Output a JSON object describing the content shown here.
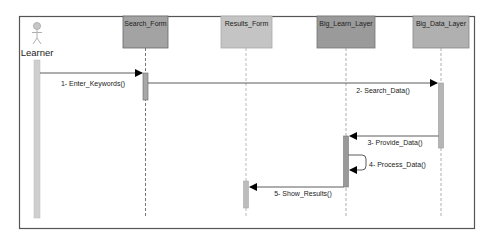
{
  "diagram": {
    "type": "sequence",
    "actor": {
      "name": "Learner"
    },
    "participants": [
      {
        "id": "search_form",
        "name": "Search_Form",
        "color": "#a3a3a3"
      },
      {
        "id": "results_form",
        "name": "Results_Form",
        "color": "#bdbdbd"
      },
      {
        "id": "big_learn_layer",
        "name": "Big_Learn_Layer",
        "color": "#9a9a9a"
      },
      {
        "id": "big_data_layer",
        "name": "Big_Data_Layer",
        "color": "#b0b0b0"
      }
    ],
    "messages": [
      {
        "label": "1- Enter_Keywords()",
        "from": "Learner",
        "to": "Search_Form"
      },
      {
        "label": "2- Search_Data()",
        "from": "Search_Form",
        "to": "Big_Data_Layer"
      },
      {
        "label": "3- Provide_Data()",
        "from": "Big_Data_Layer",
        "to": "Big_Learn_Layer"
      },
      {
        "label": "4- Process_Data()",
        "from": "Big_Learn_Layer",
        "to": "Big_Learn_Layer"
      },
      {
        "label": "5- Show_Results()",
        "from": "Big_Learn_Layer",
        "to": "Results_Form"
      }
    ]
  }
}
